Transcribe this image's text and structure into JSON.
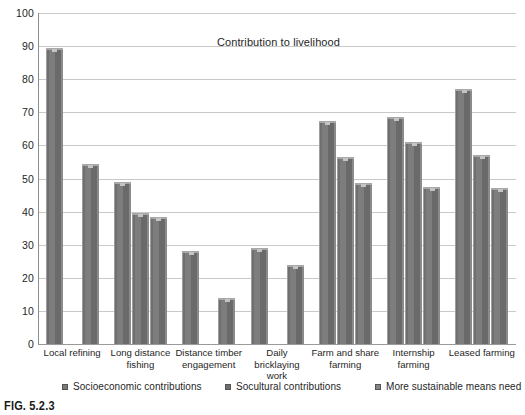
{
  "figure": {
    "caption": "FIG. 5.2.3"
  },
  "chart_data": {
    "type": "bar",
    "title": "Contribution to livelihood",
    "xlabel": "",
    "ylabel": "",
    "ylim": [
      0,
      100
    ],
    "yticks": [
      0,
      10,
      20,
      30,
      40,
      50,
      60,
      70,
      80,
      90,
      100
    ],
    "ytick_labels": [
      "0",
      "10",
      "20",
      "30",
      "40",
      "50",
      "60",
      "70",
      "80",
      "90",
      "100"
    ],
    "grid": true,
    "legend_position": "bottom",
    "categories": [
      "Local refining",
      "Long distance\nfishing",
      "Distance timber\nengagement",
      "Daily bricklaying\nwork",
      "Farm and share\nfarming",
      "Internship\nfarming",
      "Leased farming"
    ],
    "series": [
      {
        "name": "Socioeconomic contributions",
        "color": "#7a7a7a",
        "values": [
          89.5,
          49.0,
          28.0,
          29.0,
          67.5,
          68.5,
          77.0
        ]
      },
      {
        "name": "Socultural contributions",
        "color": "#6f6f6f",
        "values": [
          null,
          39.5,
          null,
          null,
          56.5,
          61.0,
          57.0
        ]
      },
      {
        "name": "More sustainable means need",
        "color": "#868686",
        "values": [
          54.5,
          38.5,
          14.0,
          24.0,
          48.5,
          47.5,
          47.0
        ]
      }
    ]
  }
}
